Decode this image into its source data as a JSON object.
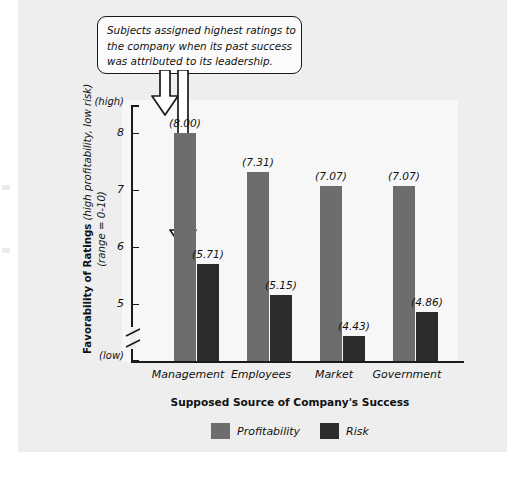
{
  "figure": {
    "annotation": {
      "name": "callout",
      "lines": [
        "Subjects assigned highest ratings to",
        "the company when its past success",
        "was attributed to its leadership."
      ]
    }
  },
  "chart_data": {
    "type": "bar",
    "title": "",
    "xlabel": "Supposed Source of Company's Success",
    "ylabel": "Favorability of Ratings (high profitability, low risk) (range = 0-10)",
    "ylabel_parts": {
      "strong": "Favorability of Ratings",
      "italic_1": "(high profitability, low risk)",
      "italic_2": "(range = 0-10)"
    },
    "categories": [
      "Management",
      "Employees",
      "Market",
      "Government"
    ],
    "series": [
      {
        "name": "Profitability",
        "color": "#6d6d6d",
        "values": [
          8.0,
          7.31,
          7.07,
          7.07
        ],
        "labels": [
          "(8.00)",
          "(7.31)",
          "(7.07)",
          "(7.07)"
        ]
      },
      {
        "name": "Risk",
        "color": "#2c2c2c",
        "values": [
          5.71,
          5.15,
          4.43,
          4.86
        ],
        "labels": [
          "(5.71)",
          "(5.15)",
          "(4.43)",
          "(4.86)"
        ]
      }
    ],
    "yaxis": {
      "ticks": [
        8,
        7,
        6,
        5
      ],
      "tick_labels": [
        "8",
        "7",
        "6",
        "5"
      ],
      "high_label": "(high)",
      "low_label": "(low)",
      "broken_axis": true,
      "ylim": [
        4.3,
        8.6
      ]
    },
    "grid": false,
    "legend_position": "bottom"
  }
}
